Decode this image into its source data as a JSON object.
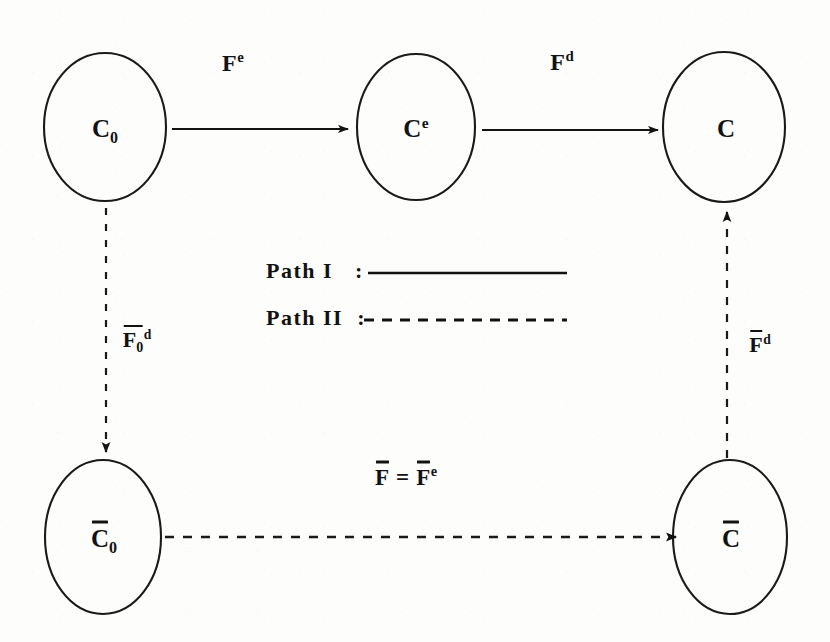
{
  "figure": {
    "type": "commutative-diagram",
    "background_color": "#fdfdfc",
    "ink_color": "#121212",
    "width": 830,
    "height": 642
  },
  "nodes": [
    {
      "id": "C0",
      "name": "node-c0",
      "base": "C",
      "subscript": "0",
      "superscript": "",
      "overbar": false,
      "cx": 105,
      "cy": 127,
      "rx": 61,
      "ry": 74
    },
    {
      "id": "Ce",
      "name": "node-ce",
      "base": "C",
      "subscript": "",
      "superscript": "e",
      "overbar": false,
      "cx": 416,
      "cy": 127,
      "rx": 59,
      "ry": 73
    },
    {
      "id": "C",
      "name": "node-c",
      "base": "C",
      "subscript": "",
      "superscript": "",
      "overbar": false,
      "cx": 724,
      "cy": 127,
      "rx": 61,
      "ry": 75
    },
    {
      "id": "C0bar",
      "name": "node-c0-bar",
      "base": "C",
      "subscript": "0",
      "superscript": "",
      "overbar": true,
      "cx": 103,
      "cy": 537,
      "rx": 58,
      "ry": 77
    },
    {
      "id": "Cbar",
      "name": "node-c-bar",
      "base": "C",
      "subscript": "",
      "superscript": "",
      "overbar": true,
      "cx": 730,
      "cy": 537,
      "rx": 57,
      "ry": 77
    }
  ],
  "arrows": [
    {
      "id": "a1",
      "name": "arrow-c0-to-ce",
      "style": "solid",
      "path": "Path I",
      "x1": 172,
      "y1": 129,
      "x2": 348,
      "y2": 129,
      "label": {
        "base": "F",
        "superscript": "e",
        "subscript": "",
        "overbar": false,
        "x": 233,
        "y": 63
      }
    },
    {
      "id": "a2",
      "name": "arrow-ce-to-c",
      "style": "solid",
      "path": "Path I",
      "x1": 482,
      "y1": 130,
      "x2": 658,
      "y2": 130,
      "label": {
        "base": "F",
        "superscript": "d",
        "subscript": "",
        "overbar": false,
        "x": 562,
        "y": 62
      }
    },
    {
      "id": "a3",
      "name": "arrow-c0-to-c0-bar",
      "style": "dashed",
      "path": "Path II",
      "x1": 106,
      "y1": 208,
      "x2": 106,
      "y2": 452,
      "label": {
        "base": "F",
        "superscript": "d",
        "subscript": "0",
        "overbar": true,
        "x": 137,
        "y": 340
      }
    },
    {
      "id": "a4",
      "name": "arrow-c0-bar-to-c-bar",
      "style": "dashed",
      "path": "Path II",
      "x1": 165,
      "y1": 537,
      "x2": 676,
      "y2": 537,
      "label": {
        "base": "F",
        "superscript": "",
        "subscript": "",
        "overbar": true,
        "x": 406,
        "y": 477
      }
    },
    {
      "id": "a5",
      "name": "arrow-c-bar-to-c",
      "style": "dashed",
      "path": "Path II",
      "x1": 727,
      "y1": 458,
      "x2": 727,
      "y2": 212,
      "label": {
        "base": "F",
        "superscript": "d",
        "subscript": "",
        "overbar": true,
        "x": 760,
        "y": 345
      }
    }
  ],
  "equation_label": {
    "name": "equation-f-equals-fe-bar",
    "text_plain": "F̄ = F̄ e",
    "lhs": "F",
    "operator": "=",
    "rhs_base": "F",
    "rhs_superscript": "e",
    "x": 406,
    "y": 477
  },
  "legend": {
    "name": "path-legend",
    "entries": [
      {
        "label": "Path I",
        "separator": ":",
        "line_style": "solid",
        "label_x": 266,
        "label_y": 271,
        "line_x1": 368,
        "line_x2": 567,
        "line_y": 273
      },
      {
        "label": "Path II",
        "separator": ":",
        "line_style": "dashed",
        "label_x": 266,
        "label_y": 318,
        "line_x1": 364,
        "line_x2": 567,
        "line_y": 320
      }
    ]
  }
}
